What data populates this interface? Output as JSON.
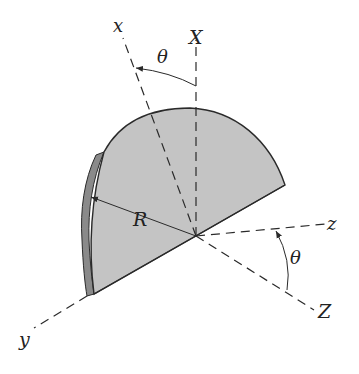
{
  "diagram": {
    "type": "rotating semicircular disk with body and space axes",
    "colors": {
      "disk_face": "#c4c4c4",
      "disk_edge": "#8a8a8a",
      "lines": "#2a2a2a",
      "background": "#ffffff"
    },
    "labels": {
      "x": "x",
      "X": "X",
      "y": "y",
      "z": "z",
      "Z": "Z",
      "R": "R",
      "theta_top": "θ",
      "theta_right": "θ"
    },
    "axes": [
      {
        "name": "x",
        "kind": "body",
        "direction": "up-left",
        "style": "dashed"
      },
      {
        "name": "X",
        "kind": "space",
        "direction": "up",
        "style": "dashed"
      },
      {
        "name": "y",
        "kind": "body",
        "direction": "down-left",
        "style": "dashed"
      },
      {
        "name": "z",
        "kind": "body",
        "direction": "right",
        "style": "dashed"
      },
      {
        "name": "Z",
        "kind": "space",
        "direction": "down-right",
        "style": "dashed"
      }
    ],
    "angles": [
      {
        "label": "θ",
        "between": [
          "X",
          "x"
        ]
      },
      {
        "label": "θ",
        "between": [
          "Z",
          "z"
        ]
      }
    ],
    "dimension": {
      "label": "R",
      "meaning": "radius of semicircular disk"
    }
  }
}
